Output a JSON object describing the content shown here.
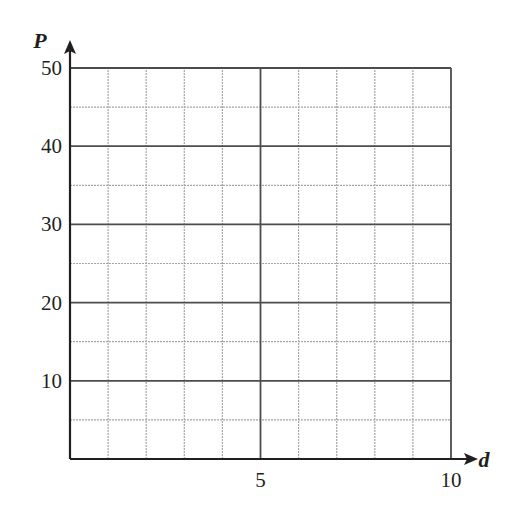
{
  "chart_data": {
    "type": "line",
    "title": "",
    "xlabel": "d",
    "ylabel": "P",
    "xlim": [
      0,
      10
    ],
    "ylim": [
      0,
      50
    ],
    "x_ticks": [
      5,
      10
    ],
    "y_ticks": [
      10,
      20,
      30,
      40,
      50
    ],
    "x_tick_labels": [
      "5",
      "10"
    ],
    "y_tick_labels": [
      "10",
      "20",
      "30",
      "40",
      "50"
    ],
    "grid": true,
    "grid_major": {
      "x_step": 5,
      "y_step": 10
    },
    "grid_minor": {
      "x_step": 1,
      "y_step": 5
    },
    "series": [],
    "legend": null
  },
  "colors": {
    "axis": "#231f20",
    "major_grid": "#4d4d4d",
    "minor_grid": "#a6a6a6",
    "text": "#231f20"
  }
}
